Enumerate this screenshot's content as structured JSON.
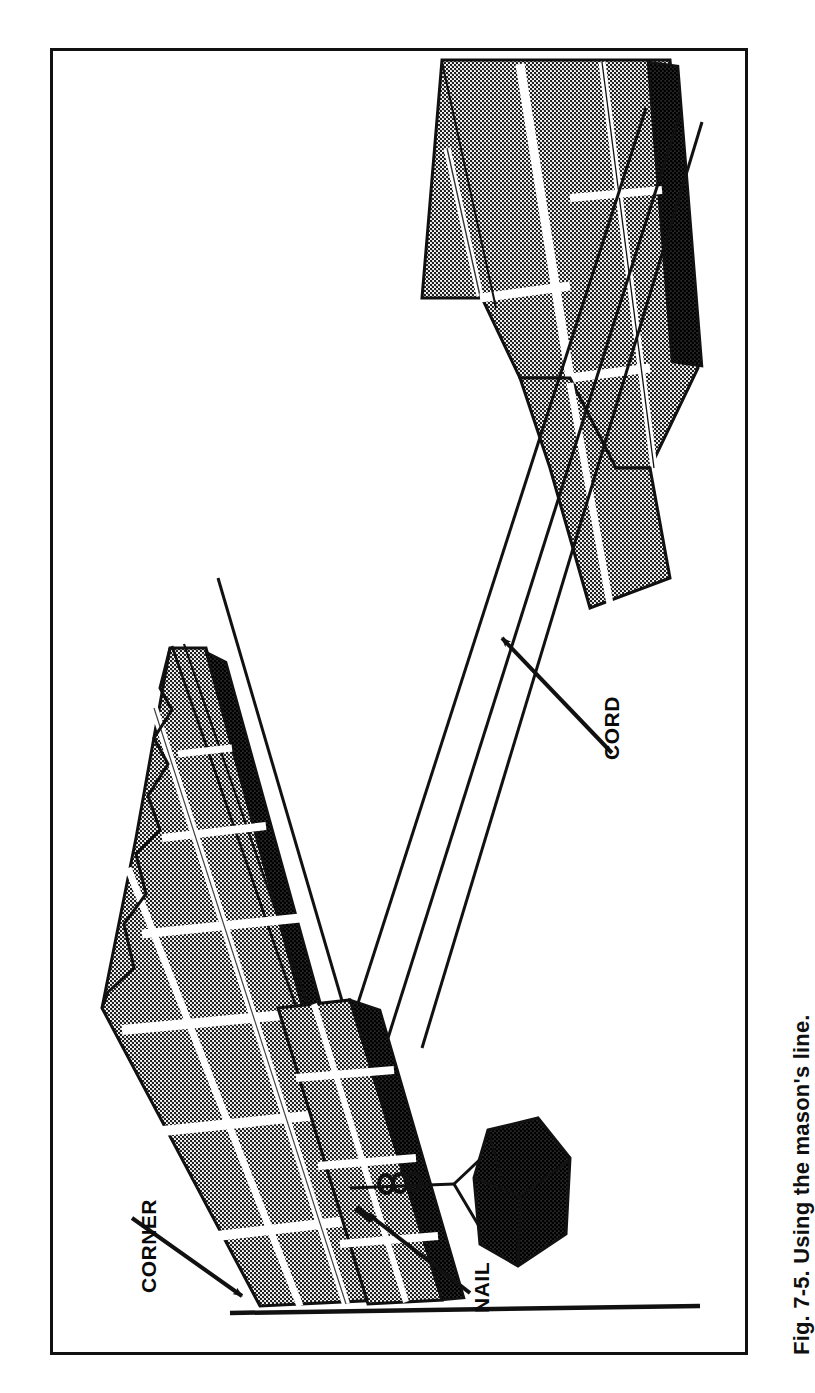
{
  "figure": {
    "caption": "Fig. 7-5. Using the mason's line.",
    "number": "7-5",
    "title": "Using the mason's line.",
    "orientation": "rotated-90-ccw",
    "frame": {
      "border_color": "#111111",
      "fill_color": "#ffffff",
      "border_width_px": 3
    }
  },
  "labels": {
    "corner": "CORNER",
    "nail": "NAIL",
    "cord": "CORD"
  },
  "annotations": [
    {
      "name": "corner-callout",
      "text": "CORNER",
      "rotation_deg": -90,
      "leader": "arrow pointing down-right to the base of the near brick corner"
    },
    {
      "name": "nail-callout",
      "text": "NAIL",
      "rotation_deg": -90,
      "leader": "arrow pointing up-left to the nail set in the mortar joint"
    },
    {
      "name": "cord-callout",
      "text": "CORD",
      "rotation_deg": -90,
      "leader": "arrow pointing up-left to the stretched mason's line"
    }
  ],
  "scene": {
    "description": "Perspective line drawing of a brick wall corner (lead) with a mason's line stretched from a nail at the near corner to a distant brick course; a loose brick acts as an anchor weight.",
    "elements": [
      "near-corner-brick-lead",
      "far-brick-course",
      "masons-line-cord",
      "nail-in-joint",
      "anchor-brick-weight",
      "ground-line",
      "cord-knot"
    ]
  },
  "colors": {
    "ink": "#111111",
    "brick_fill": "#6f6f6f",
    "mortar": "#ffffff",
    "paper": "#ffffff"
  }
}
